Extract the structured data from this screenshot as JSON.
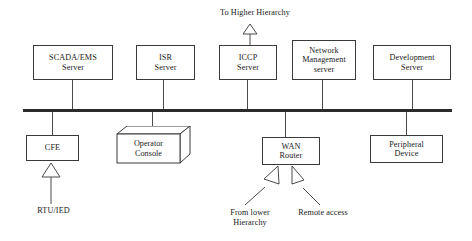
{
  "diagram": {
    "bus": {
      "label": "network-bus",
      "color": "#2b2b2b",
      "x": 23,
      "y": 110,
      "width": 429,
      "thickness": 3
    },
    "line_color": "#4a4a4a",
    "box_border_color": "#3a3a3a",
    "background": "#ffffff",
    "text_color": "#1a1a1a"
  },
  "top_nodes": [
    {
      "id": "scada-ems-server",
      "label": "SCADA/EMS\nServer",
      "x": 33,
      "y": 45,
      "w": 80,
      "h": 35,
      "connector_x": 72
    },
    {
      "id": "isr-server",
      "label": "ISR\nServer",
      "x": 136,
      "y": 45,
      "w": 59,
      "h": 35,
      "connector_x": 163
    },
    {
      "id": "iccp-server",
      "label": "ICCP\nServer",
      "x": 219,
      "y": 45,
      "w": 58,
      "h": 35,
      "connector_x": 247
    },
    {
      "id": "network-management-server",
      "label": "Network\nManagement\nserver",
      "x": 292,
      "y": 40,
      "w": 64,
      "h": 40,
      "connector_x": 322
    },
    {
      "id": "development-server",
      "label": "Development\nServer",
      "x": 373,
      "y": 45,
      "w": 78,
      "h": 35,
      "connector_x": 412
    }
  ],
  "bottom_nodes": [
    {
      "id": "cfe",
      "label": "CFE",
      "x": 26,
      "y": 135,
      "w": 53,
      "h": 26,
      "connector_x": 52
    },
    {
      "id": "operator-console",
      "label": "Operator\nConsole",
      "x": 117,
      "y": 134,
      "w": 62,
      "h": 29,
      "connector_x": 152,
      "shape": "3d-box"
    },
    {
      "id": "wan-router",
      "label": "WAN\nRouter",
      "x": 262,
      "y": 137,
      "w": 58,
      "h": 28,
      "connector_x": 285
    },
    {
      "id": "peripheral-device",
      "label": "Peripheral\nDevice",
      "x": 370,
      "y": 135,
      "w": 73,
      "h": 28,
      "connector_x": 406
    }
  ],
  "annotations": [
    {
      "id": "to-higher-hierarchy",
      "label": "To Higher Hierarchy",
      "x": 205,
      "y": 8,
      "w": 100
    },
    {
      "id": "rtu-ied",
      "label": "RTU/IED",
      "x": 26,
      "y": 207,
      "w": 55
    },
    {
      "id": "from-lower-hierarchy",
      "label": "From lower\nHierarchy",
      "x": 219,
      "y": 209,
      "w": 62
    },
    {
      "id": "remote-access",
      "label": "Remote access",
      "x": 288,
      "y": 209,
      "w": 70
    }
  ],
  "arrows": [
    {
      "id": "arrow-to-higher-hierarchy",
      "from": "iccp-server",
      "to": "to-higher-hierarchy",
      "direction": "up",
      "style": "hollow-triangle"
    },
    {
      "id": "arrow-rtu-ied-to-cfe",
      "from": "rtu-ied",
      "to": "cfe",
      "direction": "up",
      "style": "hollow-triangle"
    },
    {
      "id": "arrow-from-lower-hierarchy",
      "from": "from-lower-hierarchy",
      "to": "wan-router",
      "direction": "up-right",
      "style": "hollow-triangle"
    },
    {
      "id": "arrow-remote-access",
      "from": "remote-access",
      "to": "wan-router",
      "direction": "up-left",
      "style": "hollow-triangle"
    }
  ]
}
